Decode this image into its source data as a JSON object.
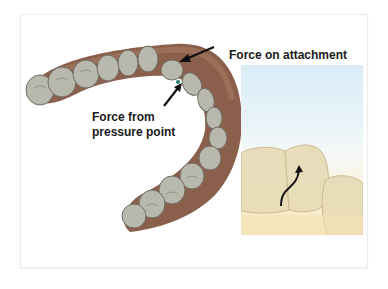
{
  "figure": {
    "type": "dental aligner force diagram",
    "labels": {
      "force_on_attachment": "Force on attachment",
      "force_from_pressure_line1": "Force from",
      "force_from_pressure_line2": "pressure point"
    },
    "panels": [
      {
        "name": "dental-arch-3d-model",
        "description": "3D model of lower dental arch with aligner, grey teeth on brown gum"
      },
      {
        "name": "aligner-inset-photo",
        "description": "close-up photo of clear aligner over teeth with curved arrow"
      }
    ],
    "colors": {
      "tooth": "#b9b8ad",
      "tooth_shadow": "#7d7b72",
      "gum": "#8a5f4b",
      "gum_light": "#a87a63",
      "arrow": "#111111",
      "text": "#1a1a1a",
      "inset_sky": "#d9edf7",
      "inset_sand": "#f6e7c0",
      "attachment_marker": "#1f7a6a"
    }
  }
}
